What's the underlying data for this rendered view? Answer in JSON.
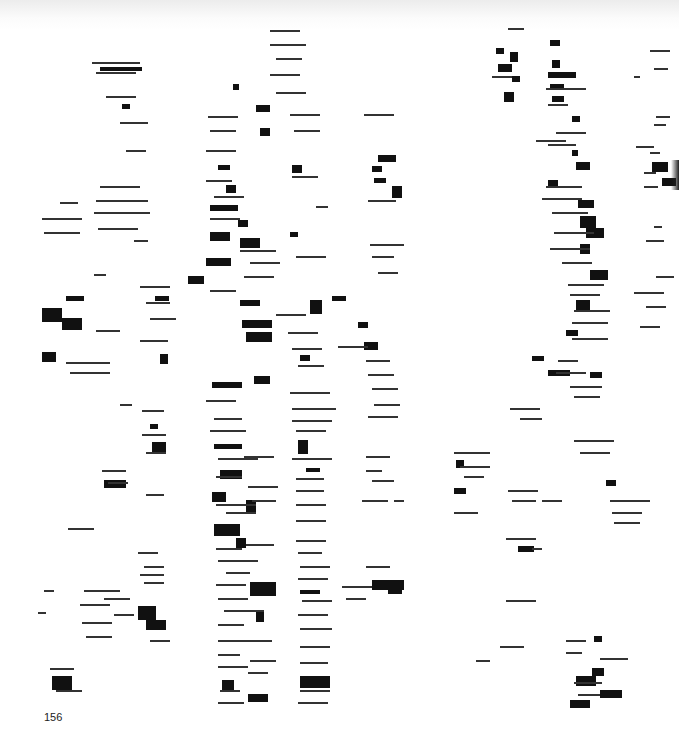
{
  "page": {
    "page_number": "156",
    "background": "#ffffff",
    "ink": "#111111"
  },
  "artwork": {
    "description": "abstract composition of black horizontal bars and thin lines arranged in loose vertical columns",
    "columns": [
      {
        "x_center": 110,
        "y_range": [
          60,
          700
        ]
      },
      {
        "x_center": 240,
        "y_range": [
          30,
          710
        ]
      },
      {
        "x_center": 310,
        "y_range": [
          30,
          710
        ]
      },
      {
        "x_center": 380,
        "y_range": [
          110,
          600
        ]
      },
      {
        "x_center": 560,
        "y_range": [
          30,
          710
        ]
      },
      {
        "x_center": 655,
        "y_range": [
          50,
          530
        ]
      }
    ],
    "blocks": [
      [
        100,
        67,
        42,
        4
      ],
      [
        122,
        104,
        8,
        5
      ],
      [
        233,
        84,
        6,
        6
      ],
      [
        256,
        105,
        14,
        7
      ],
      [
        260,
        128,
        10,
        8
      ],
      [
        218,
        165,
        12,
        5
      ],
      [
        226,
        185,
        10,
        8
      ],
      [
        210,
        205,
        28,
        6
      ],
      [
        238,
        220,
        10,
        7
      ],
      [
        210,
        232,
        20,
        9
      ],
      [
        240,
        238,
        20,
        10
      ],
      [
        206,
        258,
        25,
        8
      ],
      [
        292,
        165,
        10,
        8
      ],
      [
        378,
        155,
        18,
        7
      ],
      [
        372,
        166,
        10,
        6
      ],
      [
        392,
        186,
        10,
        12
      ],
      [
        374,
        178,
        12,
        5
      ],
      [
        290,
        232,
        8,
        5
      ],
      [
        42,
        308,
        20,
        14
      ],
      [
        62,
        318,
        20,
        12
      ],
      [
        42,
        352,
        14,
        10
      ],
      [
        66,
        296,
        18,
        5
      ],
      [
        188,
        276,
        16,
        8
      ],
      [
        155,
        296,
        14,
        5
      ],
      [
        240,
        300,
        20,
        6
      ],
      [
        242,
        320,
        30,
        8
      ],
      [
        246,
        332,
        26,
        10
      ],
      [
        310,
        300,
        12,
        14
      ],
      [
        332,
        296,
        14,
        5
      ],
      [
        358,
        322,
        10,
        6
      ],
      [
        364,
        342,
        14,
        8
      ],
      [
        160,
        354,
        8,
        10
      ],
      [
        212,
        382,
        30,
        6
      ],
      [
        254,
        376,
        16,
        8
      ],
      [
        300,
        355,
        10,
        6
      ],
      [
        214,
        444,
        28,
        5
      ],
      [
        220,
        470,
        22,
        9
      ],
      [
        212,
        492,
        14,
        10
      ],
      [
        246,
        500,
        10,
        14
      ],
      [
        214,
        524,
        26,
        12
      ],
      [
        236,
        538,
        10,
        10
      ],
      [
        298,
        440,
        10,
        14
      ],
      [
        306,
        468,
        14,
        4
      ],
      [
        104,
        480,
        22,
        8
      ],
      [
        152,
        442,
        14,
        10
      ],
      [
        150,
        424,
        8,
        5
      ],
      [
        250,
        582,
        26,
        14
      ],
      [
        256,
        612,
        8,
        10
      ],
      [
        300,
        590,
        20,
        4
      ],
      [
        372,
        580,
        32,
        10
      ],
      [
        388,
        586,
        14,
        8
      ],
      [
        138,
        606,
        18,
        14
      ],
      [
        146,
        620,
        20,
        10
      ],
      [
        52,
        676,
        20,
        14
      ],
      [
        222,
        680,
        12,
        10
      ],
      [
        248,
        694,
        20,
        8
      ],
      [
        300,
        676,
        30,
        12
      ],
      [
        496,
        48,
        8,
        6
      ],
      [
        510,
        52,
        8,
        10
      ],
      [
        498,
        64,
        14,
        8
      ],
      [
        512,
        76,
        8,
        6
      ],
      [
        504,
        92,
        10,
        10
      ],
      [
        550,
        40,
        10,
        6
      ],
      [
        552,
        60,
        8,
        8
      ],
      [
        548,
        72,
        28,
        6
      ],
      [
        550,
        84,
        14,
        6
      ],
      [
        552,
        96,
        12,
        6
      ],
      [
        572,
        116,
        8,
        6
      ],
      [
        572,
        150,
        6,
        6
      ],
      [
        576,
        162,
        14,
        8
      ],
      [
        548,
        180,
        10,
        6
      ],
      [
        578,
        200,
        16,
        8
      ],
      [
        580,
        216,
        16,
        12
      ],
      [
        586,
        228,
        18,
        10
      ],
      [
        652,
        162,
        16,
        10
      ],
      [
        662,
        178,
        14,
        8
      ],
      [
        580,
        244,
        10,
        10
      ],
      [
        590,
        270,
        18,
        10
      ],
      [
        576,
        300,
        14,
        10
      ],
      [
        566,
        330,
        12,
        6
      ],
      [
        532,
        356,
        12,
        5
      ],
      [
        548,
        370,
        22,
        6
      ],
      [
        590,
        372,
        12,
        6
      ],
      [
        456,
        460,
        8,
        8
      ],
      [
        454,
        488,
        12,
        6
      ],
      [
        518,
        546,
        16,
        6
      ],
      [
        606,
        480,
        10,
        6
      ],
      [
        576,
        676,
        20,
        10
      ],
      [
        592,
        668,
        12,
        8
      ],
      [
        600,
        690,
        22,
        8
      ],
      [
        570,
        700,
        20,
        8
      ],
      [
        594,
        636,
        8,
        6
      ]
    ],
    "lines": [
      [
        92,
        62,
        48
      ],
      [
        96,
        72,
        40
      ],
      [
        106,
        96,
        30
      ],
      [
        120,
        122,
        28
      ],
      [
        126,
        150,
        20
      ],
      [
        100,
        186,
        40
      ],
      [
        96,
        200,
        52
      ],
      [
        94,
        212,
        56
      ],
      [
        98,
        228,
        40
      ],
      [
        42,
        218,
        40
      ],
      [
        44,
        232,
        36
      ],
      [
        60,
        202,
        18
      ],
      [
        134,
        240,
        14
      ],
      [
        94,
        274,
        12
      ],
      [
        270,
        30,
        30
      ],
      [
        270,
        44,
        36
      ],
      [
        276,
        58,
        26
      ],
      [
        270,
        74,
        30
      ],
      [
        276,
        92,
        30
      ],
      [
        208,
        116,
        30
      ],
      [
        210,
        130,
        26
      ],
      [
        206,
        150,
        30
      ],
      [
        290,
        114,
        30
      ],
      [
        294,
        130,
        26
      ],
      [
        292,
        176,
        26
      ],
      [
        206,
        180,
        26
      ],
      [
        214,
        196,
        30
      ],
      [
        210,
        218,
        30
      ],
      [
        240,
        250,
        36
      ],
      [
        250,
        262,
        30
      ],
      [
        244,
        276,
        30
      ],
      [
        296,
        256,
        30
      ],
      [
        316,
        206,
        12
      ],
      [
        364,
        114,
        30
      ],
      [
        368,
        200,
        28
      ],
      [
        370,
        244,
        34
      ],
      [
        372,
        256,
        22
      ],
      [
        378,
        272,
        20
      ],
      [
        66,
        362,
        44
      ],
      [
        70,
        372,
        40
      ],
      [
        96,
        330,
        24
      ],
      [
        140,
        340,
        28
      ],
      [
        140,
        286,
        30
      ],
      [
        146,
        302,
        24
      ],
      [
        150,
        318,
        26
      ],
      [
        210,
        290,
        26
      ],
      [
        276,
        314,
        30
      ],
      [
        288,
        332,
        30
      ],
      [
        292,
        348,
        30
      ],
      [
        298,
        365,
        26
      ],
      [
        338,
        346,
        30
      ],
      [
        366,
        360,
        24
      ],
      [
        368,
        374,
        26
      ],
      [
        372,
        388,
        26
      ],
      [
        374,
        404,
        26
      ],
      [
        368,
        416,
        30
      ],
      [
        290,
        392,
        40
      ],
      [
        292,
        408,
        44
      ],
      [
        292,
        420,
        40
      ],
      [
        296,
        430,
        30
      ],
      [
        206,
        400,
        30
      ],
      [
        214,
        418,
        28
      ],
      [
        210,
        430,
        36
      ],
      [
        218,
        458,
        40
      ],
      [
        244,
        456,
        30
      ],
      [
        216,
        476,
        26
      ],
      [
        248,
        486,
        30
      ],
      [
        252,
        500,
        24
      ],
      [
        216,
        504,
        40
      ],
      [
        226,
        512,
        30
      ],
      [
        292,
        458,
        40
      ],
      [
        296,
        478,
        28
      ],
      [
        296,
        490,
        28
      ],
      [
        296,
        504,
        30
      ],
      [
        296,
        520,
        30
      ],
      [
        246,
        544,
        28
      ],
      [
        216,
        548,
        26
      ],
      [
        218,
        560,
        40
      ],
      [
        226,
        572,
        24
      ],
      [
        216,
        584,
        30
      ],
      [
        218,
        598,
        30
      ],
      [
        224,
        610,
        40
      ],
      [
        218,
        624,
        26
      ],
      [
        218,
        640,
        30
      ],
      [
        218,
        654,
        22
      ],
      [
        218,
        666,
        30
      ],
      [
        220,
        690,
        20
      ],
      [
        218,
        702,
        26
      ],
      [
        244,
        640,
        28
      ],
      [
        250,
        660,
        26
      ],
      [
        248,
        672,
        20
      ],
      [
        296,
        540,
        30
      ],
      [
        298,
        552,
        24
      ],
      [
        300,
        566,
        30
      ],
      [
        298,
        578,
        30
      ],
      [
        302,
        600,
        30
      ],
      [
        298,
        614,
        30
      ],
      [
        300,
        628,
        32
      ],
      [
        300,
        646,
        30
      ],
      [
        300,
        662,
        28
      ],
      [
        300,
        690,
        30
      ],
      [
        298,
        702,
        30
      ],
      [
        342,
        586,
        30
      ],
      [
        346,
        598,
        20
      ],
      [
        366,
        566,
        24
      ],
      [
        366,
        456,
        24
      ],
      [
        366,
        470,
        16
      ],
      [
        372,
        480,
        22
      ],
      [
        362,
        500,
        26
      ],
      [
        394,
        500,
        10
      ],
      [
        68,
        528,
        26
      ],
      [
        84,
        590,
        36
      ],
      [
        80,
        604,
        30
      ],
      [
        82,
        622,
        30
      ],
      [
        86,
        636,
        26
      ],
      [
        104,
        598,
        26
      ],
      [
        114,
        614,
        20
      ],
      [
        138,
        552,
        20
      ],
      [
        144,
        566,
        20
      ],
      [
        140,
        574,
        24
      ],
      [
        144,
        582,
        20
      ],
      [
        150,
        640,
        20
      ],
      [
        50,
        668,
        24
      ],
      [
        56,
        690,
        26
      ],
      [
        102,
        470,
        24
      ],
      [
        108,
        482,
        20
      ],
      [
        146,
        494,
        18
      ],
      [
        120,
        404,
        12
      ],
      [
        142,
        410,
        22
      ],
      [
        142,
        434,
        24
      ],
      [
        146,
        452,
        20
      ],
      [
        38,
        612,
        8
      ],
      [
        44,
        590,
        10
      ],
      [
        492,
        76,
        20
      ],
      [
        508,
        28,
        16
      ],
      [
        546,
        88,
        40
      ],
      [
        548,
        104,
        20
      ],
      [
        556,
        132,
        30
      ],
      [
        510,
        408,
        30
      ],
      [
        520,
        418,
        22
      ],
      [
        536,
        140,
        30
      ],
      [
        548,
        144,
        28
      ],
      [
        546,
        186,
        36
      ],
      [
        542,
        198,
        40
      ],
      [
        552,
        212,
        36
      ],
      [
        554,
        232,
        40
      ],
      [
        550,
        248,
        40
      ],
      [
        562,
        262,
        30
      ],
      [
        568,
        284,
        36
      ],
      [
        570,
        294,
        30
      ],
      [
        574,
        310,
        36
      ],
      [
        572,
        322,
        36
      ],
      [
        572,
        338,
        36
      ],
      [
        558,
        360,
        20
      ],
      [
        556,
        372,
        30
      ],
      [
        570,
        386,
        32
      ],
      [
        574,
        396,
        26
      ],
      [
        650,
        50,
        20
      ],
      [
        654,
        68,
        14
      ],
      [
        634,
        76,
        6
      ],
      [
        656,
        116,
        14
      ],
      [
        654,
        124,
        12
      ],
      [
        636,
        146,
        18
      ],
      [
        650,
        152,
        10
      ],
      [
        644,
        172,
        12
      ],
      [
        644,
        186,
        14
      ],
      [
        654,
        226,
        8
      ],
      [
        646,
        240,
        18
      ],
      [
        656,
        276,
        18
      ],
      [
        646,
        306,
        20
      ],
      [
        634,
        292,
        30
      ],
      [
        640,
        326,
        20
      ],
      [
        574,
        440,
        40
      ],
      [
        580,
        452,
        30
      ],
      [
        454,
        452,
        36
      ],
      [
        460,
        466,
        30
      ],
      [
        464,
        476,
        20
      ],
      [
        508,
        490,
        30
      ],
      [
        512,
        500,
        24
      ],
      [
        542,
        500,
        20
      ],
      [
        454,
        512,
        24
      ],
      [
        506,
        538,
        30
      ],
      [
        532,
        548,
        10
      ],
      [
        610,
        500,
        40
      ],
      [
        612,
        512,
        30
      ],
      [
        614,
        522,
        26
      ],
      [
        506,
        600,
        30
      ],
      [
        476,
        660,
        14
      ],
      [
        500,
        646,
        24
      ],
      [
        566,
        640,
        20
      ],
      [
        566,
        652,
        16
      ],
      [
        600,
        658,
        28
      ],
      [
        574,
        682,
        28
      ],
      [
        578,
        694,
        22
      ]
    ]
  }
}
